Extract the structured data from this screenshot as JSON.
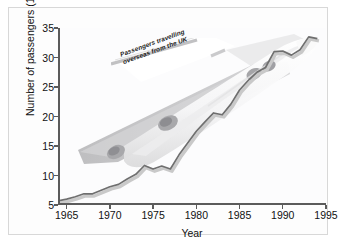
{
  "figure": {
    "annotation_line1": "Passengers travelling",
    "annotation_line2": "overseas from the UK",
    "plane_graphic": "airliner-watermark"
  },
  "chart_data": {
    "type": "line",
    "title": "Passengers travelling overseas from the UK",
    "xlabel": "Year",
    "ylabel": "Number of passengers (10⁶)",
    "ylabel_base": "Number of passengers (10",
    "ylabel_exp": "6",
    "ylabel_close": ")",
    "xlim": [
      1964,
      1995
    ],
    "ylim": [
      5,
      35
    ],
    "xticks": [
      1965,
      1970,
      1975,
      1980,
      1985,
      1990,
      1995
    ],
    "yticks": [
      5,
      10,
      15,
      20,
      25,
      30,
      35
    ],
    "grid": false,
    "legend": null,
    "line_color": "#6f6f6f",
    "shadow_color": "#c9c9c9",
    "series": [
      {
        "name": "Passengers travelling overseas from the UK",
        "x": [
          1964,
          1965,
          1966,
          1967,
          1968,
          1969,
          1970,
          1971,
          1972,
          1973,
          1974,
          1975,
          1976,
          1977,
          1978,
          1979,
          1980,
          1981,
          1982,
          1983,
          1984,
          1985,
          1986,
          1987,
          1988,
          1989,
          1990,
          1991,
          1992,
          1993,
          1994
        ],
        "values": [
          5.7,
          6.0,
          6.4,
          6.9,
          6.9,
          7.5,
          8.1,
          8.5,
          9.4,
          10.2,
          11.7,
          11.1,
          11.6,
          11.1,
          13.5,
          15.5,
          17.5,
          19.1,
          20.6,
          20.3,
          22.1,
          24.5,
          26.1,
          27.5,
          28.3,
          31.0,
          31.1,
          30.4,
          31.3,
          33.5,
          33.2
        ]
      }
    ]
  }
}
